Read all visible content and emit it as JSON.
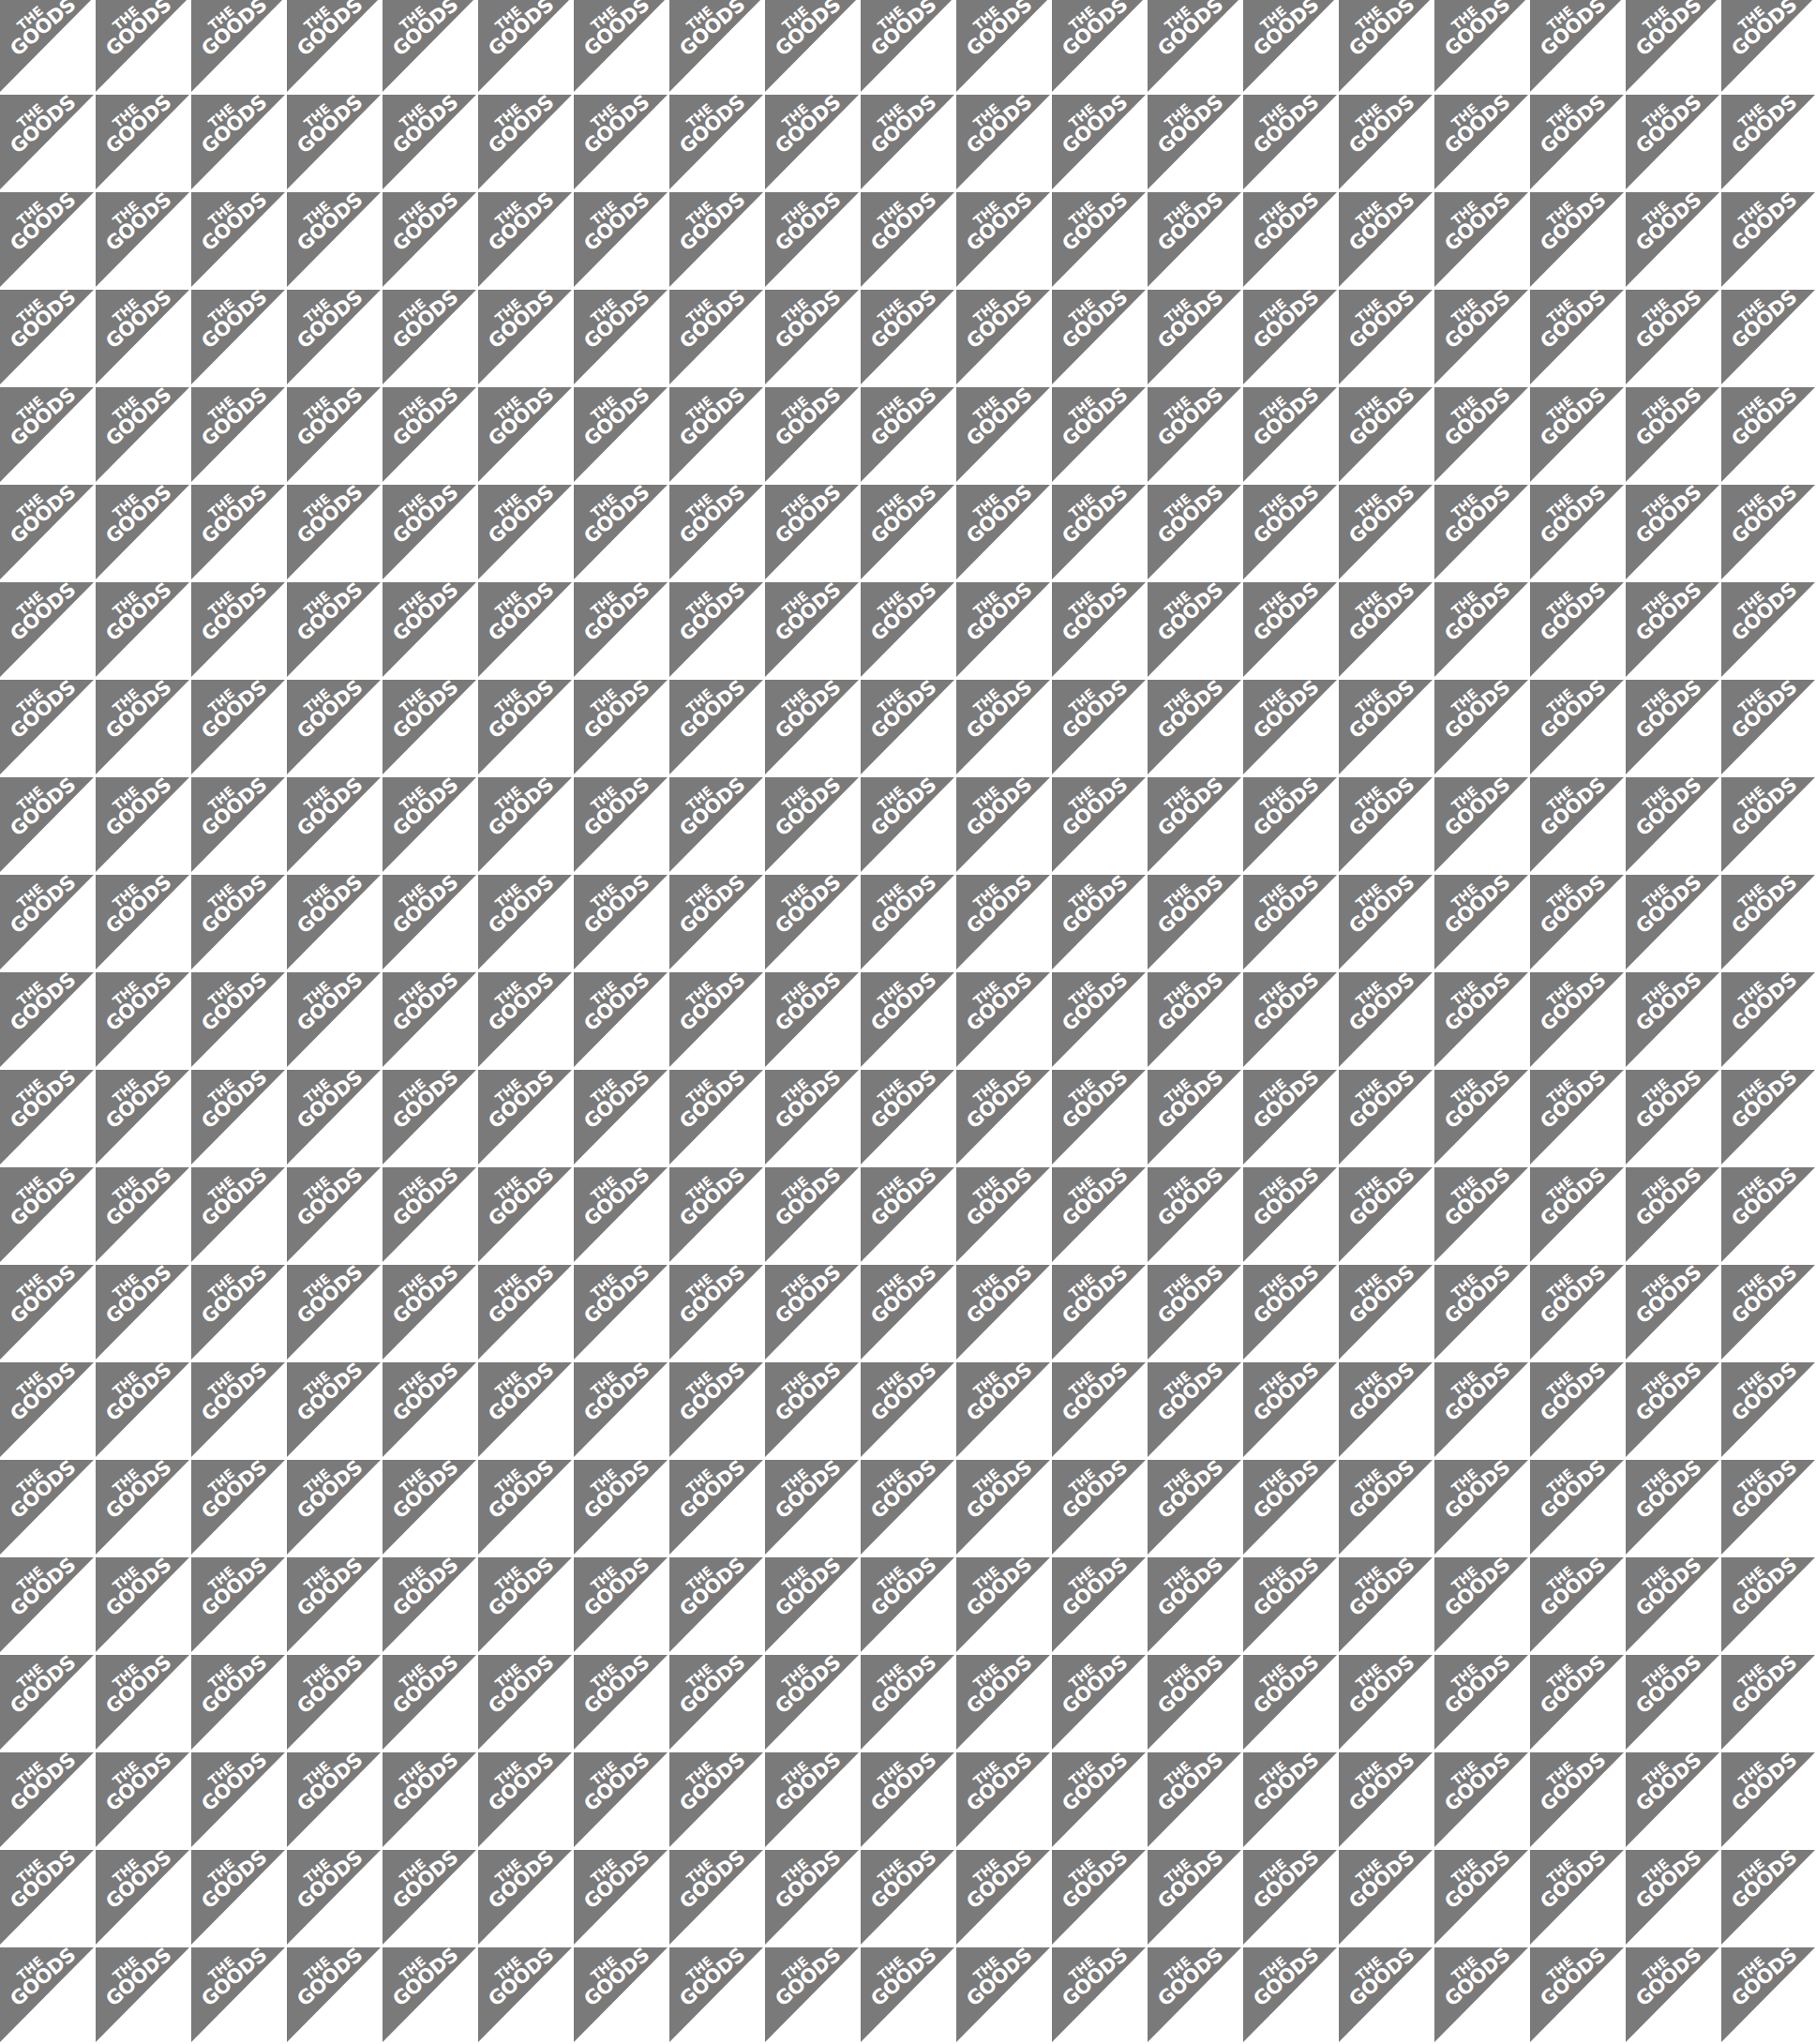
{
  "pattern": {
    "brand_line1": "THE",
    "brand_line2": "GOODS",
    "colors": {
      "triangle": "#7a7a7a",
      "background": "#ffffff",
      "text": "#ffffff"
    },
    "columns": 19,
    "rows": 21,
    "tile_width_px": 102,
    "tile_height_px": 104
  }
}
